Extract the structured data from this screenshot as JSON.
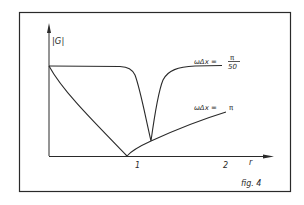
{
  "figure": {
    "caption": "fig. 4",
    "y_axis_label": "|G|",
    "x_axis_label": "r",
    "x_ticks": [
      "1",
      "2"
    ],
    "curves": [
      {
        "name": "curve-pi-over-50",
        "label_prefix": "ωΔx =",
        "label_num": "π",
        "label_den": "50",
        "description": "nearly flat at |G| max, sharp dip near r≈1.1"
      },
      {
        "name": "curve-pi",
        "label_prefix": "ωΔx =",
        "label_value": "π",
        "description": "decreases to zero at r≈0.9 then rises"
      }
    ],
    "line_color": "#2a2a2a",
    "background": "#ffffff"
  }
}
